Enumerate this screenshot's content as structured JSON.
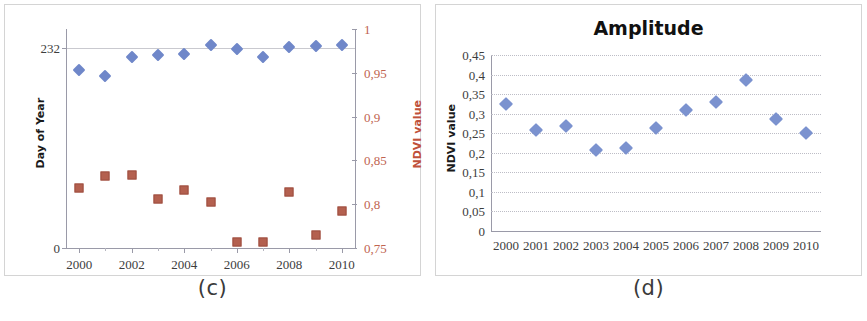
{
  "figure": {
    "panels": [
      {
        "id": "c",
        "caption": "(c)",
        "title": "",
        "left_axis_title": "Day of Year",
        "right_axis_title": "NDVI value"
      },
      {
        "id": "d",
        "caption": "(d)",
        "title": "Amplitude",
        "left_axis_title": "NDVI value",
        "right_axis_title": ""
      }
    ]
  },
  "chart_data": [
    {
      "type": "scatter",
      "panel": "c",
      "title": "",
      "xlabel": "",
      "ylabel": "Day of Year",
      "y2label": "NDVI value",
      "grid": true,
      "legend": "none",
      "x": [
        2000,
        2001,
        2002,
        2003,
        2004,
        2005,
        2006,
        2007,
        2008,
        2009,
        2010
      ],
      "xtick_labels": [
        "2000",
        "2002",
        "2004",
        "2006",
        "2008",
        "2010"
      ],
      "xlim": [
        1999.5,
        2010.5
      ],
      "ylim": [
        0,
        254
      ],
      "ytick_labels": [
        "0",
        "232"
      ],
      "ytick_values": [
        0,
        232
      ],
      "y2lim": [
        0.75,
        1
      ],
      "y2tick_labels": [
        "0,75",
        "0,8",
        "0,85",
        "0,9",
        "0,95",
        "1"
      ],
      "y2tick_values": [
        0.75,
        0.8,
        0.85,
        0.9,
        0.95,
        1
      ],
      "series": [
        {
          "name": "Day of Year",
          "marker": "diamond",
          "color": "#6f87c9",
          "axis": "left",
          "values": [
            207,
            199,
            222,
            224,
            225,
            236,
            231,
            221,
            233,
            234,
            235
          ]
        },
        {
          "name": "NDVI value",
          "marker": "square",
          "color": "#b4604f",
          "axis": "right",
          "values": [
            0.819,
            0.832,
            0.833,
            0.806,
            0.816,
            0.803,
            0.757,
            0.757,
            0.814,
            0.765,
            0.792
          ]
        }
      ]
    },
    {
      "type": "scatter",
      "panel": "d",
      "title": "Amplitude",
      "xlabel": "",
      "ylabel": "NDVI value",
      "grid": true,
      "legend": "none",
      "x": [
        2000,
        2001,
        2002,
        2003,
        2004,
        2005,
        2006,
        2007,
        2008,
        2009,
        2010
      ],
      "xtick_labels": [
        "2000",
        "2001",
        "2002",
        "2003",
        "2004",
        "2005",
        "2006",
        "2007",
        "2008",
        "2009",
        "2010"
      ],
      "xlim": [
        1999.5,
        2010.5
      ],
      "ylim": [
        0,
        0.45
      ],
      "ytick_labels": [
        "0",
        "0,05",
        "0,1",
        "0,15",
        "0,2",
        "0,25",
        "0,3",
        "0,35",
        "0,4",
        "0,45"
      ],
      "ytick_values": [
        0,
        0.05,
        0.1,
        0.15,
        0.2,
        0.25,
        0.3,
        0.35,
        0.4,
        0.45
      ],
      "series": [
        {
          "name": "Amplitude",
          "marker": "diamond",
          "color": "#7b92cf",
          "axis": "left",
          "values": [
            0.325,
            0.257,
            0.268,
            0.206,
            0.213,
            0.264,
            0.31,
            0.331,
            0.386,
            0.287,
            0.25
          ]
        }
      ]
    }
  ],
  "colors": {
    "series_blue": "#6f87c9",
    "series_red": "#b4604f",
    "right_axis_text": "#c0644f",
    "grid": "#c9c9cf",
    "panel_border": "#d4d4d4"
  }
}
